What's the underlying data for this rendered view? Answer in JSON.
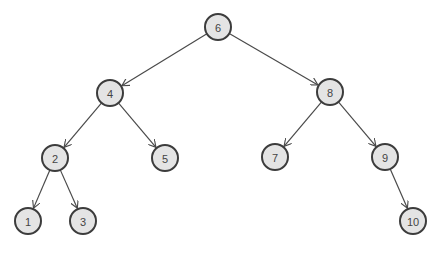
{
  "diagram": {
    "type": "binary-search-tree",
    "node_radius": 13,
    "colors": {
      "node_fill": "#e4e4e4",
      "node_stroke": "#3c3c3c",
      "edge": "#4a4a4a",
      "label": "#444444"
    },
    "nodes": [
      {
        "id": "n6",
        "label": "6",
        "x": 218,
        "y": 27
      },
      {
        "id": "n4",
        "label": "4",
        "x": 110,
        "y": 93
      },
      {
        "id": "n8",
        "label": "8",
        "x": 330,
        "y": 92
      },
      {
        "id": "n2",
        "label": "2",
        "x": 55,
        "y": 158
      },
      {
        "id": "n5",
        "label": "5",
        "x": 165,
        "y": 158
      },
      {
        "id": "n7",
        "label": "7",
        "x": 275,
        "y": 157
      },
      {
        "id": "n9",
        "label": "9",
        "x": 385,
        "y": 157
      },
      {
        "id": "n1",
        "label": "1",
        "x": 28,
        "y": 221
      },
      {
        "id": "n3",
        "label": "3",
        "x": 83,
        "y": 221
      },
      {
        "id": "n10",
        "label": "10",
        "x": 413,
        "y": 221
      }
    ],
    "edges": [
      {
        "from": "n6",
        "to": "n4"
      },
      {
        "from": "n6",
        "to": "n8"
      },
      {
        "from": "n4",
        "to": "n2"
      },
      {
        "from": "n4",
        "to": "n5"
      },
      {
        "from": "n8",
        "to": "n7"
      },
      {
        "from": "n8",
        "to": "n9"
      },
      {
        "from": "n2",
        "to": "n1"
      },
      {
        "from": "n2",
        "to": "n3"
      },
      {
        "from": "n9",
        "to": "n10"
      }
    ]
  }
}
